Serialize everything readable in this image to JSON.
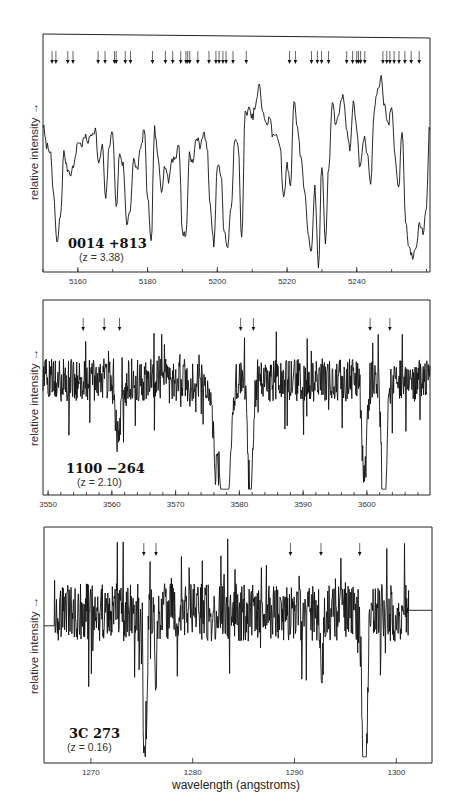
{
  "figure": {
    "xlabel": "wavelength (angstroms)",
    "ylabel": "relative intensity →"
  },
  "chart_data": [
    {
      "type": "line",
      "panel": "top",
      "object": "0014 +813",
      "redshift_label": "(z = 3.38)",
      "redshift": 3.38,
      "xlabel": "",
      "ylabel": "relative intensity →",
      "xlim": [
        5150,
        5261
      ],
      "ylim": [
        0,
        1
      ],
      "x_ticks": [
        5160,
        5180,
        5200,
        5220,
        5240
      ],
      "x_tick_labels": [
        "5160",
        "5180",
        "5200",
        "5220",
        "5240"
      ],
      "minor_tick_step": 10,
      "frame_px": {
        "left": 43,
        "right": 430,
        "top": 34,
        "bottom": 272
      },
      "absorption_arrows": [
        5152.6,
        5153.7,
        5157.1,
        5158.6,
        5165.8,
        5167.8,
        5170.5,
        5171.0,
        5173.6,
        5175.1,
        5181.4,
        5185.1,
        5187.2,
        5189.5,
        5191.0,
        5191.5,
        5192.1,
        5194.4,
        5197.6,
        5199.6,
        5200.5,
        5201.6,
        5202.5,
        5204.5,
        5208.3,
        5220.7,
        5222.4,
        5227.0,
        5228.7,
        5229.9,
        5231.9,
        5237.1,
        5238.8,
        5240.0,
        5240.5,
        5241.1,
        5242.3,
        5247.5,
        5248.6,
        5249.5,
        5250.7,
        5252.1,
        5253.8,
        5255.6,
        5257.9
      ],
      "series": [
        {
          "name": "spectrum",
          "x": [
            5150,
            5151,
            5152,
            5153,
            5154,
            5155,
            5156,
            5157,
            5158,
            5159,
            5160,
            5161,
            5162,
            5163,
            5164,
            5165,
            5166,
            5167,
            5168,
            5169,
            5170,
            5171,
            5172,
            5173,
            5174,
            5175,
            5176,
            5177,
            5178,
            5179,
            5180,
            5181,
            5182,
            5183,
            5184,
            5185,
            5186,
            5187,
            5188,
            5189,
            5190,
            5191,
            5192,
            5193,
            5194,
            5195,
            5196,
            5197,
            5198,
            5199,
            5200,
            5201,
            5202,
            5203,
            5204,
            5205,
            5206,
            5207,
            5208,
            5209,
            5210,
            5211,
            5212,
            5213,
            5214,
            5215,
            5216,
            5217,
            5218,
            5219,
            5220,
            5221,
            5222,
            5223,
            5224,
            5225,
            5226,
            5227,
            5228,
            5229,
            5230,
            5231,
            5232,
            5233,
            5234,
            5235,
            5236,
            5237,
            5238,
            5239,
            5240,
            5241,
            5242,
            5243,
            5244,
            5245,
            5246,
            5247,
            5248,
            5249,
            5250,
            5251,
            5252,
            5253,
            5254,
            5255,
            5256,
            5257,
            5258,
            5259,
            5260,
            5261
          ],
          "y": [
            0.72,
            0.62,
            0.6,
            0.38,
            0.12,
            0.26,
            0.58,
            0.5,
            0.48,
            0.53,
            0.64,
            0.62,
            0.66,
            0.64,
            0.68,
            0.7,
            0.52,
            0.62,
            0.34,
            0.62,
            0.69,
            0.3,
            0.58,
            0.52,
            0.22,
            0.3,
            0.54,
            0.5,
            0.6,
            0.7,
            0.36,
            0.12,
            0.7,
            0.55,
            0.4,
            0.52,
            0.44,
            0.55,
            0.56,
            0.62,
            0.18,
            0.16,
            0.58,
            0.53,
            0.66,
            0.62,
            0.68,
            0.62,
            0.3,
            0.12,
            0.52,
            0.48,
            0.18,
            0.1,
            0.32,
            0.64,
            0.62,
            0.14,
            0.78,
            0.8,
            0.76,
            0.82,
            0.92,
            0.8,
            0.72,
            0.76,
            0.66,
            0.68,
            0.62,
            0.34,
            0.52,
            0.42,
            0.86,
            0.7,
            0.56,
            0.4,
            0.18,
            0.08,
            0.4,
            0.0,
            0.52,
            0.14,
            0.52,
            0.84,
            0.72,
            0.8,
            0.88,
            0.72,
            0.6,
            0.84,
            0.7,
            0.5,
            0.66,
            0.58,
            0.42,
            0.8,
            0.9,
            0.96,
            0.82,
            0.72,
            0.82,
            0.56,
            0.4,
            0.7,
            0.24,
            0.1,
            0.06,
            0.12,
            0.22,
            0.18,
            0.32,
            0.8,
            0.7
          ]
        }
      ]
    },
    {
      "type": "line",
      "panel": "middle",
      "object": "1100 −264",
      "redshift_label": "(z = 2.10)",
      "redshift": 2.1,
      "xlabel": "",
      "ylabel": "relative intensity →",
      "xlim": [
        3549.2,
        3609.9
      ],
      "ylim": [
        0,
        1
      ],
      "x_ticks": [
        3550,
        3560,
        3570,
        3580,
        3590,
        3600
      ],
      "x_tick_labels": [
        "3550",
        "3560",
        "3570",
        "3580",
        "3590",
        "3600"
      ],
      "minor_tick_step": 2,
      "frame_px": {
        "left": 43,
        "right": 430,
        "top": 300,
        "bottom": 495
      },
      "absorption_arrows": [
        3555.5,
        3558.8,
        3561.2,
        3580.2,
        3582.2,
        3600.5,
        3603.6
      ],
      "absorption_lines": [
        {
          "center": 3577.8,
          "depth": 0.97,
          "width": 0.9
        },
        {
          "center": 3581.7,
          "depth": 0.78,
          "width": 0.5
        },
        {
          "center": 3602.7,
          "depth": 0.9,
          "width": 0.5
        },
        {
          "center": 3599.6,
          "depth": 0.55,
          "width": 0.5
        },
        {
          "center": 3561.0,
          "depth": 0.35,
          "width": 0.6
        },
        {
          "center": 3576.3,
          "depth": 0.45,
          "width": 0.6
        }
      ],
      "continuum_level": 0.62,
      "noise_amplitude": 0.12
    },
    {
      "type": "line",
      "panel": "bottom",
      "object": "3C 273",
      "redshift_label": "(z = 0.16)",
      "redshift": 0.16,
      "xlabel": "wavelength (angstroms)",
      "ylabel": "relative intensity →",
      "xlim": [
        1265.4,
        1303.5
      ],
      "ylim": [
        0,
        1
      ],
      "x_ticks": [
        1270,
        1280,
        1290,
        1300
      ],
      "x_tick_labels": [
        "1270",
        "1280",
        "1290",
        "1300"
      ],
      "frame_px": {
        "left": 44,
        "right": 432,
        "top": 527,
        "bottom": 763
      },
      "absorption_arrows": [
        1275.2,
        1276.4,
        1289.6,
        1292.6,
        1296.4
      ],
      "absorption_lines": [
        {
          "center": 1275.3,
          "depth": 0.72,
          "width": 0.25
        },
        {
          "center": 1296.9,
          "depth": 0.98,
          "width": 0.3
        },
        {
          "center": 1276.4,
          "depth": 0.3,
          "width": 0.15
        },
        {
          "center": 1292.7,
          "depth": 0.28,
          "width": 0.15
        }
      ],
      "flat_left": {
        "x": [
          1265.4,
          1266.4
        ],
        "y": 0.6
      },
      "flat_right": {
        "x": [
          1301.2,
          1303.5
        ],
        "y": 0.67
      },
      "data_range": [
        1266.4,
        1301.2
      ],
      "continuum_level": 0.66,
      "noise_amplitude": 0.13
    }
  ]
}
